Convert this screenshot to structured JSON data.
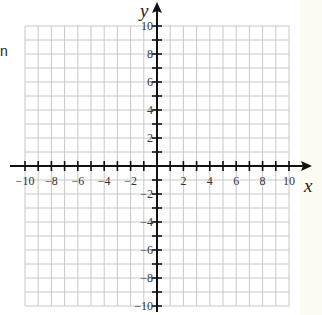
{
  "stray_text": "n",
  "chart_data": {
    "type": "coordinate-grid",
    "title": "",
    "xlabel": "x",
    "ylabel": "y",
    "xlim": [
      -10,
      10
    ],
    "ylim": [
      -10,
      10
    ],
    "grid": true,
    "grid_step": 1,
    "x_tick_labels": [
      "-10",
      "-8",
      "-6",
      "-4",
      "-2",
      "2",
      "4",
      "6",
      "8",
      "10"
    ],
    "y_tick_labels": [
      "10",
      "8",
      "6",
      "4",
      "2",
      "-2",
      "-4",
      "-6",
      "-8",
      "-10"
    ],
    "colors": {
      "grid": "#c8c8c8",
      "axis": "#111111",
      "background": "#ffffff"
    }
  }
}
